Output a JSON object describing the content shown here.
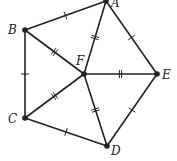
{
  "diagram": {
    "type": "geometry",
    "points": {
      "A": {
        "x": 106,
        "y": 1,
        "label": "A",
        "lx": 111,
        "ly": 7
      },
      "B": {
        "x": 25,
        "y": 30,
        "label": "B",
        "lx": 8,
        "ly": 34
      },
      "C": {
        "x": 25,
        "y": 118,
        "label": "C",
        "lx": 8,
        "ly": 123
      },
      "D": {
        "x": 107,
        "y": 146,
        "label": "D",
        "lx": 111,
        "ly": 155
      },
      "E": {
        "x": 157,
        "y": 74,
        "label": "E",
        "lx": 162,
        "ly": 79
      },
      "F": {
        "x": 84,
        "y": 74,
        "label": "F",
        "lx": 76,
        "ly": 65
      }
    },
    "segments": [
      {
        "from": "A",
        "to": "B",
        "ticks": 1
      },
      {
        "from": "B",
        "to": "C",
        "ticks": 1
      },
      {
        "from": "C",
        "to": "D",
        "ticks": 1
      },
      {
        "from": "D",
        "to": "E",
        "ticks": 1
      },
      {
        "from": "E",
        "to": "A",
        "ticks": 1
      },
      {
        "from": "F",
        "to": "A",
        "ticks": 2
      },
      {
        "from": "F",
        "to": "B",
        "ticks": 2
      },
      {
        "from": "F",
        "to": "C",
        "ticks": 2
      },
      {
        "from": "F",
        "to": "D",
        "ticks": 2
      },
      {
        "from": "F",
        "to": "E",
        "ticks": 2
      }
    ],
    "colors": {
      "stroke": "#222222",
      "background": "#ffffff"
    }
  }
}
